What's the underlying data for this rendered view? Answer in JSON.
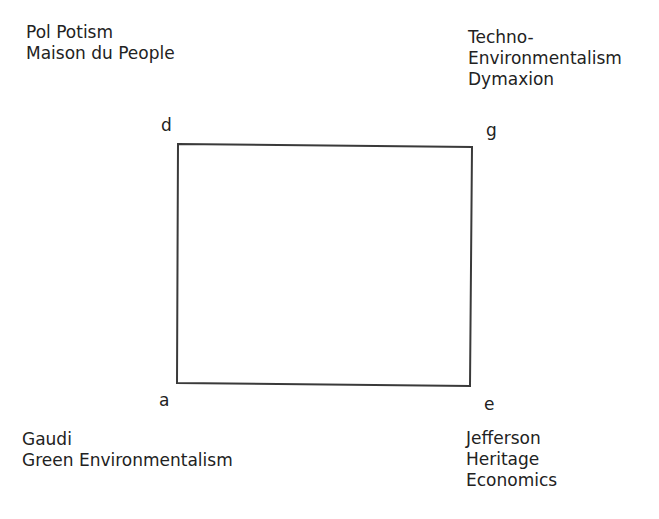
{
  "diagram": {
    "type": "square-quadrant",
    "stroke_color": "#3a3a3a",
    "corners": {
      "top_left": {
        "letter": "d",
        "lines": [
          "Pol Potism",
          "Maison du People"
        ]
      },
      "top_right": {
        "letter": "g",
        "lines": [
          "Techno-",
          "Environmentalism",
          "Dymaxion"
        ]
      },
      "bottom_left": {
        "letter": "a",
        "lines": [
          "Gaudi",
          "Green Environmentalism"
        ]
      },
      "bottom_right": {
        "letter": "e",
        "lines": [
          "Jefferson",
          "Heritage",
          "Economics"
        ]
      }
    }
  }
}
